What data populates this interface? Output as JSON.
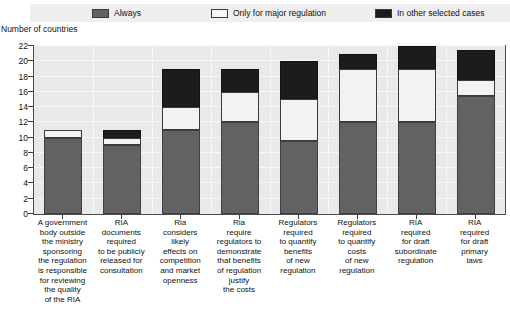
{
  "legend": {
    "items": [
      {
        "label": "Always",
        "color": "#626262",
        "name": "legend-always"
      },
      {
        "label": "Only for major regulation",
        "color": "#f2f2f2",
        "name": "legend-major"
      },
      {
        "label": "In other selected cases",
        "color": "#1c1c1c",
        "name": "legend-other"
      }
    ]
  },
  "axis_title": "Number of countries",
  "chart_data": {
    "type": "bar",
    "title": "",
    "subtitle": "",
    "xlabel": "",
    "ylabel": "Number of countries",
    "ylim": [
      0,
      22
    ],
    "yticks": [
      0,
      2,
      4,
      6,
      8,
      10,
      12,
      14,
      16,
      18,
      20,
      22
    ],
    "grid": true,
    "stacked": true,
    "legend_position": "top",
    "categories": [
      "A government body outside the ministry sponsoring the regulation is responsible for reviewing the quality of the RIA",
      "RIA documents required to be publicly released for consultation",
      "Ria considers likely effects on competition and market openness",
      "Ria require regulators to demonstrate that benefits of regulation justify the costs",
      "Regulators required to quantify benefits of new regulation",
      "Regulators required to quantify costs of new regulation",
      "RIA required for draft subordinate regulation",
      "RIA required for draft primary laws"
    ],
    "category_lines": [
      [
        "A government",
        "body outside",
        "the ministry",
        "sponsoring",
        "the regulation",
        "is responsible",
        "for reviewing",
        "the quality",
        "of the RIA"
      ],
      [
        "RIA",
        "documents",
        "required",
        "to be publicly",
        "released for",
        "consultation"
      ],
      [
        "Ria",
        "considers",
        "likely",
        "effects on",
        "competition",
        "and market",
        "openness"
      ],
      [
        "Ria",
        "require",
        "regulators to",
        "demonstrate",
        "that benefits",
        "of regulation",
        "justify",
        "the costs"
      ],
      [
        "Regulators",
        "required",
        "to quantify",
        "benefits",
        "of new",
        "regulation"
      ],
      [
        "Regulators",
        "required",
        "to quantify",
        "costs",
        "of new",
        "regulation"
      ],
      [
        "RIA",
        "required",
        "for draft",
        "subordinate",
        "regulation"
      ],
      [
        "RIA",
        "required",
        "for draft",
        "primary",
        "laws"
      ]
    ],
    "series": [
      {
        "name": "Always",
        "color": "#626262",
        "values": [
          10,
          9,
          11,
          12,
          9.5,
          12,
          12,
          15.5
        ]
      },
      {
        "name": "Only for major regulation",
        "color": "#f2f2f2",
        "values": [
          1,
          1,
          3,
          4,
          5.5,
          7,
          7,
          2
        ]
      },
      {
        "name": "In other selected cases",
        "color": "#1c1c1c",
        "values": [
          0,
          1,
          5,
          3,
          5,
          2,
          3,
          4
        ]
      }
    ],
    "totals": [
      11,
      11,
      19,
      19,
      20,
      21,
      22,
      21.5
    ]
  }
}
